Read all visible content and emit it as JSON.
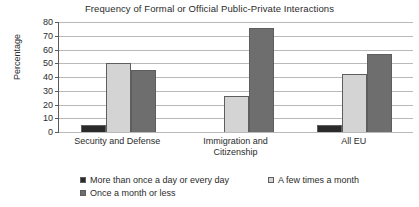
{
  "chart_data": {
    "type": "bar",
    "title": "Frequency of Formal or Official Public-Private Interactions",
    "xlabel": "",
    "ylabel": "Percentage",
    "ylim": [
      0,
      80
    ],
    "ytick_step": 10,
    "yticks": [
      80,
      70,
      60,
      50,
      40,
      30,
      20,
      10,
      0
    ],
    "grid": true,
    "legend_position": "bottom",
    "categories": [
      "Security and Defense",
      "Immigration and Citizenship",
      "All EU"
    ],
    "category_lines": [
      [
        "Security and Defense"
      ],
      [
        "Immigration and",
        "Citizenship"
      ],
      [
        "All EU"
      ]
    ],
    "series": [
      {
        "name": "More than once a day or every day",
        "color": "#2a2a2a",
        "values": [
          5,
          0,
          5
        ]
      },
      {
        "name": "A few times a month",
        "color": "#d4d4d4",
        "values": [
          50,
          26,
          42
        ]
      },
      {
        "name": "Once a month or less",
        "color": "#6e6e6e",
        "values": [
          45,
          76,
          57
        ]
      }
    ]
  },
  "axis": {
    "y_title": "Percentage"
  },
  "legend": {
    "rows": [
      [
        {
          "label": "More than once a day or every day",
          "color": "#2a2a2a"
        },
        {
          "label": "A few times a month",
          "color": "#d4d4d4"
        }
      ],
      [
        {
          "label": "Once a month or less",
          "color": "#6e6e6e"
        }
      ]
    ]
  }
}
